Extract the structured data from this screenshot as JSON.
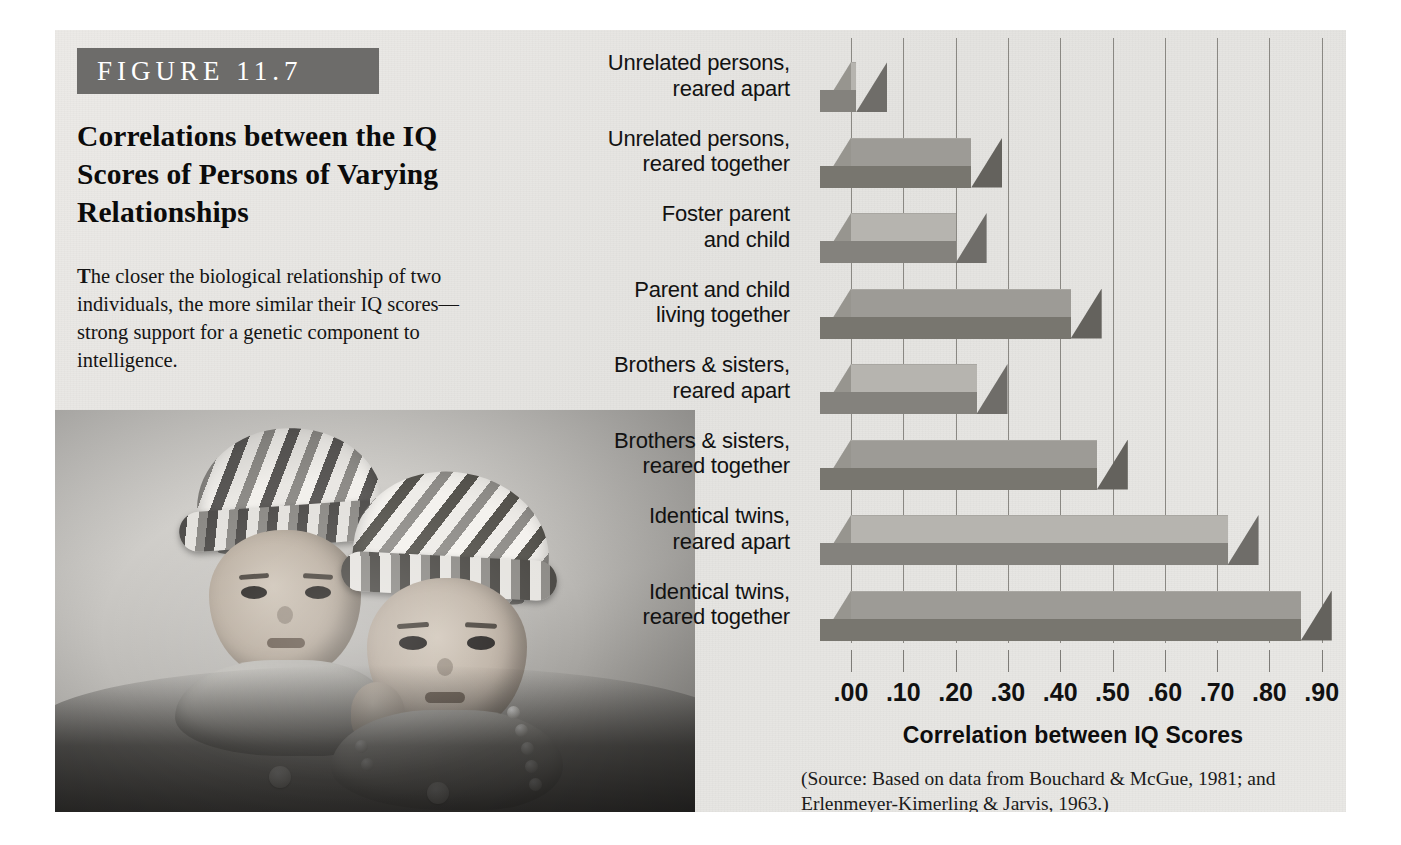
{
  "figure": {
    "banner_label": "FIGURE 11.7",
    "title": "Correlations between the IQ Scores of Persons of Varying Relationships",
    "caption_dropcap": "T",
    "caption_rest": "he closer the biological relationship of two individuals, the more similar their IQ scores—strong support for a genetic component to intelligence.",
    "source": "(Source: Based on data from Bouchard & McGue, 1981; and Erlenmeyer-Kimerling & Jarvis, 1963.)"
  },
  "photo": {
    "alt_name": "two-toddlers-in-striped-hats-photo"
  },
  "colors": {
    "banner_bg": "#6d6c6a",
    "panel_bg": "#e6e5e2",
    "bar_light_top": "#b6b4af",
    "bar_light_front": "#84827d",
    "bar_dark_top": "#9d9b96",
    "bar_dark_front": "#78766f",
    "gridline": "#8a8883",
    "text": "#111111"
  },
  "chart_data": {
    "type": "bar",
    "orientation": "horizontal",
    "title": "Correlations between the IQ Scores of Persons of Varying Relationships",
    "xlabel": "Correlation between IQ Scores",
    "ylabel": "",
    "xlim": [
      0.0,
      1.0
    ],
    "grid": true,
    "legend": "none",
    "tick_labels": [
      ".00",
      ".10",
      ".20",
      ".30",
      ".40",
      ".50",
      ".60",
      ".70",
      ".80",
      ".90"
    ],
    "tick_values": [
      0.0,
      0.1,
      0.2,
      0.3,
      0.4,
      0.5,
      0.6,
      0.7,
      0.8,
      0.9
    ],
    "categories": [
      "Unrelated persons, reared apart",
      "Unrelated persons, reared together",
      "Foster parent and child",
      "Parent and child living together",
      "Brothers & sisters, reared apart",
      "Brothers & sisters, reared together",
      "Identical twins, reared apart",
      "Identical twins, reared together"
    ],
    "values": [
      0.01,
      0.23,
      0.2,
      0.42,
      0.24,
      0.47,
      0.72,
      0.86
    ],
    "bars": [
      {
        "line1": "Unrelated persons,",
        "line2": "reared apart",
        "value": 0.01,
        "shade": "light"
      },
      {
        "line1": "Unrelated persons,",
        "line2": "reared together",
        "value": 0.23,
        "shade": "dark"
      },
      {
        "line1": "Foster parent",
        "line2": "and child",
        "value": 0.2,
        "shade": "light"
      },
      {
        "line1": "Parent and child",
        "line2": "living together",
        "value": 0.42,
        "shade": "dark"
      },
      {
        "line1": "Brothers & sisters,",
        "line2": "reared apart",
        "value": 0.24,
        "shade": "light"
      },
      {
        "line1": "Brothers & sisters,",
        "line2": "reared together",
        "value": 0.47,
        "shade": "dark"
      },
      {
        "line1": "Identical twins,",
        "line2": "reared apart",
        "value": 0.72,
        "shade": "light"
      },
      {
        "line1": "Identical twins,",
        "line2": "reared together",
        "value": 0.86,
        "shade": "dark"
      }
    ]
  }
}
